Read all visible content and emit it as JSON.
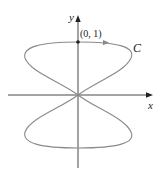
{
  "figure": {
    "curve_label": "C",
    "x_axis_label": "x",
    "y_axis_label": "y",
    "point_label": "(0, 1)",
    "colors": {
      "axis": "#333333",
      "curve": "#8a8a8a",
      "point": "#222222"
    }
  }
}
